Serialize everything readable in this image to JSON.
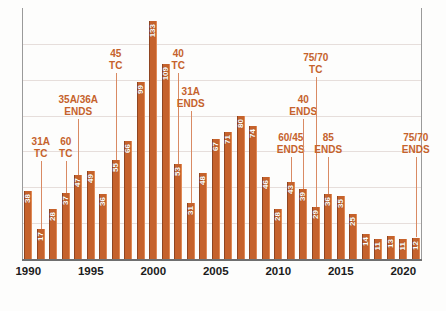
{
  "chart_data": {
    "type": "bar",
    "title": "",
    "xlabel": "",
    "ylabel": "",
    "ylim": [
      0,
      140
    ],
    "grid": true,
    "legend": "none",
    "bar_color": "#c5622c",
    "annotation_color": "#c5622c",
    "categories": [
      "1990",
      "1991",
      "1992",
      "1993",
      "1994",
      "1995",
      "1996",
      "1997",
      "1998",
      "1999",
      "2000",
      "2001",
      "2002",
      "2003",
      "2004",
      "2005",
      "2006",
      "2007",
      "2008",
      "2009",
      "2010",
      "2011",
      "2012",
      "2013",
      "2014",
      "2015",
      "2016",
      "2017",
      "2018",
      "2019",
      "2020",
      "2021"
    ],
    "values": [
      38,
      17,
      28,
      37,
      47,
      49,
      36,
      55,
      66,
      99,
      133,
      109,
      53,
      31,
      48,
      67,
      71,
      80,
      74,
      46,
      28,
      43,
      39,
      29,
      36,
      35,
      25,
      14,
      11,
      13,
      11,
      12
    ],
    "xtick_labels": [
      "1990",
      "1995",
      "2000",
      "2005",
      "2010",
      "2015",
      "2020"
    ],
    "xtick_categories": [
      "1990",
      "1995",
      "2000",
      "2005",
      "2010",
      "2015",
      "2020"
    ],
    "annotations": [
      {
        "text_line1": "31A",
        "text_line2": "TC",
        "category": "1991"
      },
      {
        "text_line1": "60",
        "text_line2": "TC",
        "category": "1993"
      },
      {
        "text_line1": "35A/36A",
        "text_line2": "ENDS",
        "category": "1994"
      },
      {
        "text_line1": "45",
        "text_line2": "TC",
        "category": "1997"
      },
      {
        "text_line1": "40",
        "text_line2": "TC",
        "category": "2002"
      },
      {
        "text_line1": "31A",
        "text_line2": "ENDS",
        "category": "2003"
      },
      {
        "text_line1": "60/45",
        "text_line2": "ENDS",
        "category": "2011"
      },
      {
        "text_line1": "40",
        "text_line2": "ENDS",
        "category": "2012"
      },
      {
        "text_line1": "75/70",
        "text_line2": "TC",
        "category": "2013"
      },
      {
        "text_line1": "85",
        "text_line2": "ENDS",
        "category": "2014"
      },
      {
        "text_line1": "75/70",
        "text_line2": "ENDS",
        "category": "2021"
      }
    ]
  }
}
